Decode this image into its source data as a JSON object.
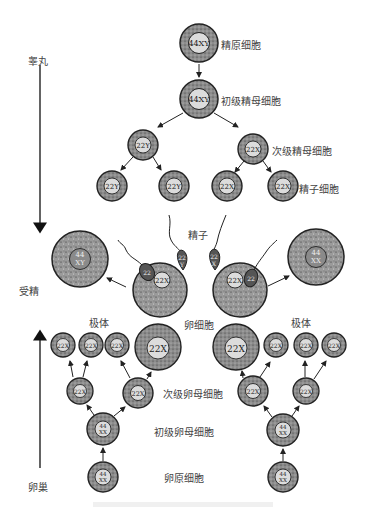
{
  "diagram": {
    "type": "gametogenesis",
    "side_labels": {
      "testis": "睾丸",
      "ovary": "卵巢",
      "fertilization": "受精"
    },
    "spermatogenesis": {
      "spermatogonium": {
        "label": "精原细胞",
        "karyotype": "44XY"
      },
      "primary_spermatocyte": {
        "label": "初级精母细胞",
        "karyotype": "44XY"
      },
      "secondary_spermatocytes": {
        "label": "次级精母细胞",
        "karyotypes": [
          "22Y",
          "22X"
        ]
      },
      "spermatids": {
        "label": "精子细胞",
        "karyotypes": [
          "22Y",
          "22Y",
          "22X",
          "22X"
        ]
      },
      "sperm": {
        "label": "精子",
        "karyotypes": [
          "22Y",
          "22X"
        ]
      }
    },
    "oogenesis": {
      "oogonium": {
        "label": "卵原细胞",
        "karyotype": "44XX"
      },
      "primary_oocyte": {
        "label": "初级卵母细胞",
        "karyotype": "44XX"
      },
      "secondary_oocyte": {
        "label": "次级卵母细胞",
        "karyotype": "22X"
      },
      "ovum": {
        "label": "卵细胞",
        "karyotype": "22X"
      },
      "polar_bodies": {
        "label": "极体",
        "karyotype": "22X"
      }
    },
    "zygotes": [
      {
        "karyotype_top": "44",
        "karyotype_bottom": "XY"
      },
      {
        "karyotype_top": "44",
        "karyotype_bottom": "XX"
      }
    ],
    "colors": {
      "cell_ring": "#8a8a8a",
      "cell_outline": "#222222",
      "nucleus": "#d9d9d9",
      "cytoplasm_egg": "#9a9a9a",
      "sperm_head": "#555555"
    }
  }
}
